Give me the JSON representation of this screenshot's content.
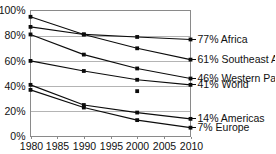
{
  "chart_data": {
    "type": "line",
    "title": "",
    "subtitle": "",
    "xlabel": "",
    "ylabel": "",
    "x": [
      1980,
      1990,
      2000,
      2010
    ],
    "xlim": [
      1980,
      2010
    ],
    "ylim": [
      0,
      100
    ],
    "xticks": [
      "1980",
      "1985",
      "1990",
      "1995",
      "2000",
      "2005",
      "2010"
    ],
    "xtick_values": [
      1980,
      1985,
      1990,
      1995,
      2000,
      2005,
      2010
    ],
    "yticks": [
      "0%",
      "20%",
      "40%",
      "60%",
      "80%",
      "100%"
    ],
    "ytick_values": [
      0,
      20,
      40,
      60,
      80,
      100
    ],
    "grid": "horizontal",
    "gridline_values": [
      20,
      40,
      60,
      80
    ],
    "legend_position": "right-inline",
    "marker": "square",
    "line_color": "#0c0c0c",
    "grid_color": "#b4b4b4",
    "frame_color": "#8a8a8a",
    "series": [
      {
        "name": "Africa",
        "end_label": "77% Africa",
        "end_value": 77,
        "values": [
          95,
          81,
          79,
          77
        ]
      },
      {
        "name": "Southeast Asia",
        "end_label": "61% Southeast Asia",
        "end_value": 61,
        "values": [
          87,
          81,
          70,
          61
        ]
      },
      {
        "name": "Western Pacific",
        "end_label": "46% Western Pacific",
        "end_value": 46,
        "values": [
          81,
          65,
          54,
          46
        ]
      },
      {
        "name": "World",
        "end_label": "41% World",
        "end_value": 41,
        "values": [
          60,
          52,
          45,
          41
        ]
      },
      {
        "name": "Americas",
        "end_label": "14% Americas",
        "end_value": 14,
        "values": [
          41,
          25,
          19,
          14
        ]
      },
      {
        "name": "Europe",
        "end_label": "7% Europe",
        "end_value": 7,
        "values": [
          37,
          23,
          13,
          7
        ]
      }
    ],
    "extra_points": [
      {
        "x": 2000,
        "y": 36,
        "note": "isolated unconnected marker"
      }
    ]
  }
}
